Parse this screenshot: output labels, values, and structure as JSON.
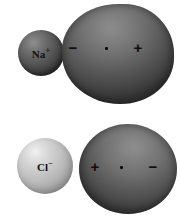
{
  "figure": {
    "background_color": "#ffffff"
  },
  "rows": [
    {
      "name": "sodium-row",
      "ion": {
        "label_main": "Na",
        "label_charge": "+",
        "color": "#4c4c4c",
        "size_px": 46
      },
      "cloud": {
        "shape": "teardrop",
        "color": "#5e5e5e",
        "left_sign": "−",
        "center_marker": "nucleus-dot",
        "right_sign": "+"
      }
    },
    {
      "name": "chloride-row",
      "ion": {
        "label_main": "Cl",
        "label_charge": "−",
        "color": "#bdbdbd",
        "size_px": 56
      },
      "cloud": {
        "shape": "ellipse",
        "color": "#616161",
        "left_sign": "+",
        "center_marker": "nucleus-dot",
        "right_sign": "−"
      }
    }
  ]
}
